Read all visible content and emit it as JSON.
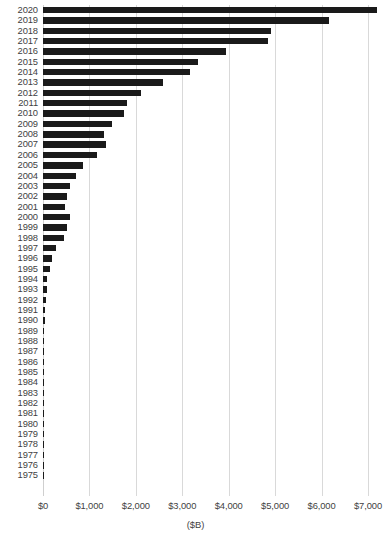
{
  "chart_data": {
    "type": "bar",
    "orientation": "horizontal",
    "title": "",
    "xlabel": "($B)",
    "ylabel": "",
    "xlim": [
      0,
      7400
    ],
    "xticks": [
      0,
      1000,
      2000,
      3000,
      4000,
      5000,
      6000,
      7000
    ],
    "xticklabels": [
      "$0",
      "$1,000",
      "$2,000",
      "$3,000",
      "$4,000",
      "$5,000",
      "$6,000",
      "$7,000"
    ],
    "grid": "vertical",
    "legend": "none",
    "bar_color": "#1a1a1a",
    "categories": [
      "2020",
      "2019",
      "2018",
      "2017",
      "2016",
      "2015",
      "2014",
      "2013",
      "2012",
      "2011",
      "2010",
      "2009",
      "2008",
      "2007",
      "2006",
      "2005",
      "2004",
      "2003",
      "2002",
      "2001",
      "2000",
      "1999",
      "1998",
      "1997",
      "1996",
      "1995",
      "1994",
      "1993",
      "1992",
      "1991",
      "1990",
      "1989",
      "1988",
      "1987",
      "1986",
      "1985",
      "1984",
      "1983",
      "1982",
      "1981",
      "1980",
      "1979",
      "1978",
      "1977",
      "1976",
      "1975"
    ],
    "values": [
      7190,
      6160,
      4910,
      4845,
      3940,
      3340,
      3165,
      2585,
      2110,
      1810,
      1745,
      1485,
      1315,
      1355,
      1160,
      860,
      710,
      580,
      515,
      475,
      580,
      515,
      450,
      280,
      195,
      140,
      85,
      80,
      60,
      45,
      38,
      30,
      25,
      20,
      17,
      14,
      12,
      10,
      9,
      8,
      7,
      6,
      5,
      4,
      3,
      3
    ]
  }
}
